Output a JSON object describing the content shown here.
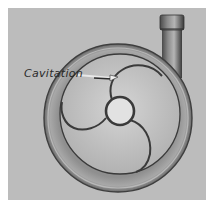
{
  "figure": {
    "annotation_label": "Cavitation",
    "colors": {
      "background": "#ffffff",
      "panel": "#bdbdbd",
      "casing_dark": "#555555",
      "casing_mid": "#9a9a9a",
      "interior": "#c9c9c9",
      "hub": "#e4e4e4",
      "line": "#3a3a3a"
    }
  }
}
